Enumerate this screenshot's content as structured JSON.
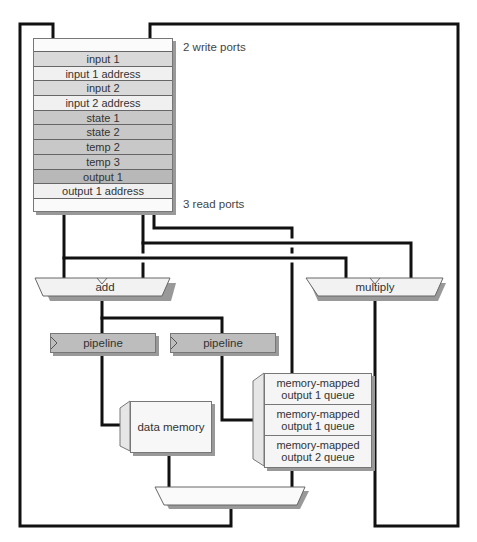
{
  "register_file": {
    "write_ports_label": "2 write ports",
    "read_ports_label": "3 read ports",
    "registers": [
      {
        "label": "input 1",
        "color": "#d9d9d9"
      },
      {
        "label": "input 1 address",
        "color": "#f0f0f0"
      },
      {
        "label": "input 2",
        "color": "#d9d9d9"
      },
      {
        "label": "input 2 address",
        "color": "#f0f0f0"
      },
      {
        "label": "state 1",
        "color": "#c8c8c8"
      },
      {
        "label": "state 2",
        "color": "#c8c8c8"
      },
      {
        "label": "temp 2",
        "color": "#c8c8c8"
      },
      {
        "label": "temp 3",
        "color": "#c8c8c8"
      },
      {
        "label": "output 1",
        "color": "#b8b8b8"
      },
      {
        "label": "output 1 address",
        "color": "#f0f0f0"
      }
    ]
  },
  "units": {
    "add": "add",
    "multiply": "multiply",
    "pipeline_1": "pipeline",
    "pipeline_2": "pipeline",
    "data_memory": "data memory"
  },
  "queues": [
    {
      "line1": "memory-mapped",
      "line2": "output 1 queue"
    },
    {
      "line1": "memory-mapped",
      "line2": "output 1 queue"
    },
    {
      "line1": "memory-mapped",
      "line2": "output 2 queue"
    }
  ]
}
